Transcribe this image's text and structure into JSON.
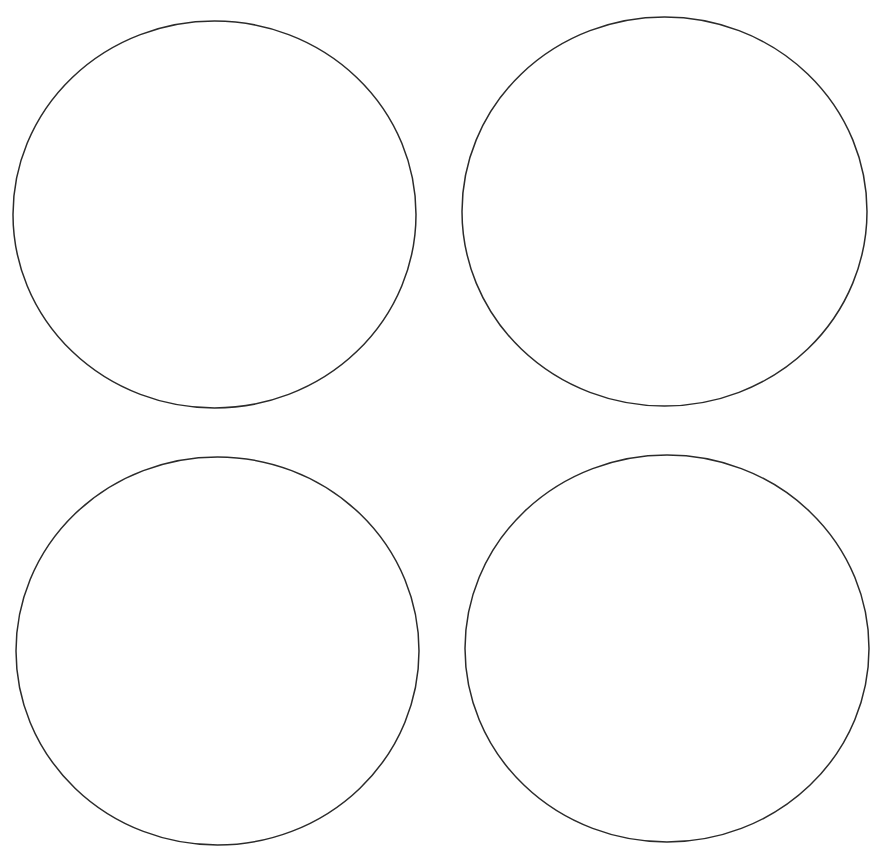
{
  "page": {
    "background": "#ffffff",
    "stroke_color": "#2b2b2b",
    "stroke_width": 1.5
  },
  "circles": [
    {
      "id": "top-left",
      "cx": 214.5,
      "cy": 214.5,
      "rx": 201.5,
      "ry": 193.5
    },
    {
      "id": "top-right",
      "cx": 664.5,
      "cy": 211.5,
      "rx": 202.5,
      "ry": 194.5
    },
    {
      "id": "bottom-left",
      "cx": 217.5,
      "cy": 651,
      "rx": 201.5,
      "ry": 194
    },
    {
      "id": "bottom-right",
      "cx": 667,
      "cy": 648.5,
      "rx": 202,
      "ry": 193.5
    }
  ]
}
